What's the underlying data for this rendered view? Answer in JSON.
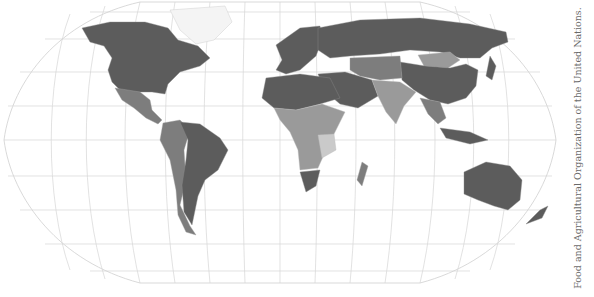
{
  "map": {
    "projection": "robinson-like world map",
    "colors": {
      "darkest": "#5c5c5c",
      "dark": "#7d7d7d",
      "medium": "#9a9a9a",
      "light": "#cacaca",
      "grid": "#d6d6d6"
    }
  },
  "credit": {
    "text": "Food and Agricultural Organization of the United Nations."
  }
}
